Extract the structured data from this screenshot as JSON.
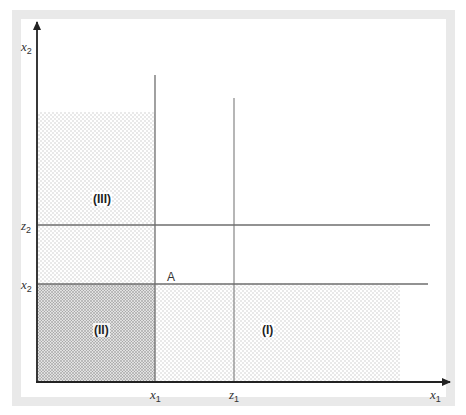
{
  "diagram": {
    "axes": {
      "x_axis_label": {
        "var": "x",
        "sub": "1"
      },
      "y_axis_label": {
        "var": "x",
        "sub": "2"
      }
    },
    "x_ticks": [
      {
        "var": "x",
        "sub": "1"
      },
      {
        "var": "z",
        "sub": "1"
      }
    ],
    "y_ticks": [
      {
        "var": "z",
        "sub": "2"
      },
      {
        "var": "x",
        "sub": "2"
      }
    ],
    "point_label": "A",
    "regions": [
      {
        "id": "I",
        "label": "(I)",
        "shading": "light-dots"
      },
      {
        "id": "II",
        "label": "(II)",
        "shading": "dense-dots"
      },
      {
        "id": "III",
        "label": "(III)",
        "shading": "light-dots"
      }
    ],
    "colors": {
      "frame": "#e9e9e9",
      "axis": "#333333",
      "guide_line": "#777777",
      "light_dot": "#c8c8c8",
      "dense_dot": "#8a8a8a"
    }
  }
}
